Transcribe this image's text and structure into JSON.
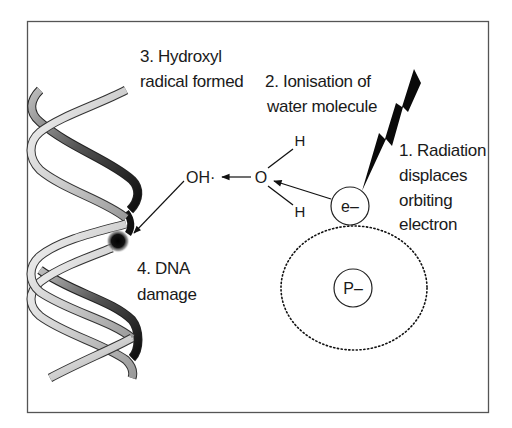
{
  "diagram": {
    "frame": {
      "x": 27,
      "y": 21,
      "width": 462,
      "height": 392,
      "stroke": "#555555"
    },
    "steps": [
      {
        "id": 1,
        "lines": [
          "1. Radiation",
          "displaces",
          "orbiting",
          "electron"
        ]
      },
      {
        "id": 2,
        "lines": [
          "2. Ionisation of",
          "water molecule"
        ]
      },
      {
        "id": 3,
        "lines": [
          "3. Hydroxyl",
          "radical formed"
        ]
      },
      {
        "id": 4,
        "lines": [
          "4. DNA",
          "damage"
        ]
      }
    ],
    "molecule": {
      "oxygen": "O",
      "hydrogen_top": "H",
      "hydrogen_bottom": "H",
      "hydroxyl_radical": "OH·"
    },
    "atom": {
      "electron_label": "e–",
      "nucleus_label": "P–"
    },
    "icons": {
      "radiation": "lightning-bolt",
      "dna": "double-helix",
      "damage": "dark-blurred-dot"
    },
    "colors": {
      "ink": "#111111",
      "strand_light": "#d9d9d9",
      "strand_dark": "#222222",
      "frame": "#555555",
      "background": "#ffffff"
    }
  }
}
